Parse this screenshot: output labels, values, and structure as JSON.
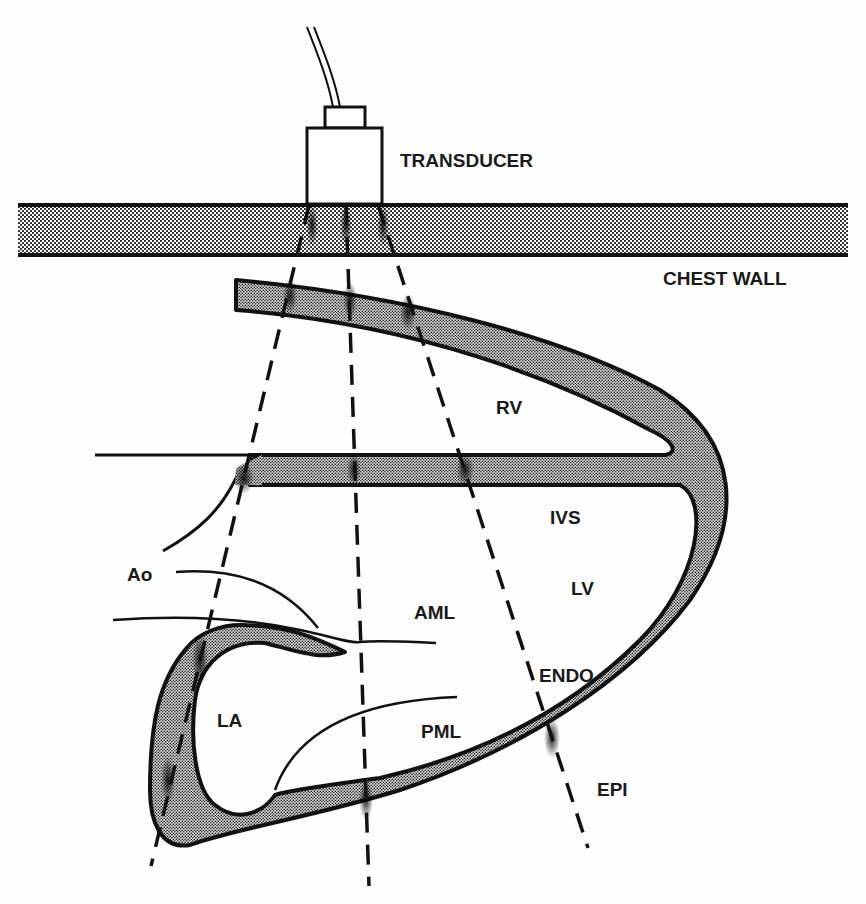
{
  "figure": {
    "type": "schematic"
  },
  "labels": {
    "transducer": "TRANSDUCER",
    "chest_wall": "CHEST WALL",
    "rv": "RV",
    "ivs": "IVS",
    "ao": "Ao",
    "lv": "LV",
    "aml": "AML",
    "endo": "ENDO",
    "la": "LA",
    "pml": "PML",
    "epi": "EPI"
  },
  "colors": {
    "ink": "#111111",
    "stipple_fill": "#9a9a9a",
    "background": "#fefefe"
  }
}
